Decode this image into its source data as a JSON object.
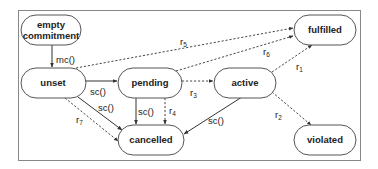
{
  "diagram": {
    "type": "state-machine",
    "frame": {
      "x": 18,
      "y": 10,
      "w": 342,
      "h": 150
    },
    "nodes": [
      {
        "id": "empty",
        "lines": [
          "empty",
          "commitment"
        ],
        "x": 21,
        "y": 15,
        "w": 60,
        "h": 30
      },
      {
        "id": "unset",
        "lines": [
          "unset"
        ],
        "x": 21,
        "y": 68,
        "w": 65,
        "h": 30
      },
      {
        "id": "pending",
        "lines": [
          "pending"
        ],
        "x": 118,
        "y": 68,
        "w": 64,
        "h": 30
      },
      {
        "id": "active",
        "lines": [
          "active"
        ],
        "x": 214,
        "y": 68,
        "w": 62,
        "h": 30
      },
      {
        "id": "fulfilled",
        "lines": [
          "fulfilled"
        ],
        "x": 294,
        "y": 15,
        "w": 62,
        "h": 30
      },
      {
        "id": "cancelled",
        "lines": [
          "cancelled"
        ],
        "x": 118,
        "y": 125,
        "w": 66,
        "h": 30
      },
      {
        "id": "violated",
        "lines": [
          "violated"
        ],
        "x": 294,
        "y": 125,
        "w": 62,
        "h": 30
      }
    ],
    "edges": [
      {
        "from": "empty",
        "to": "unset",
        "label": "mc()",
        "style": "solid"
      },
      {
        "from": "unset",
        "to": "pending",
        "label": "sc()",
        "style": "solid"
      },
      {
        "from": "unset",
        "to": "cancelled",
        "label": "sc()",
        "style": "solid"
      },
      {
        "from": "unset",
        "to": "cancelled",
        "label": "r7",
        "style": "dashed"
      },
      {
        "from": "unset",
        "to": "fulfilled",
        "label": "r5",
        "style": "dashed"
      },
      {
        "from": "pending",
        "to": "active",
        "label": "r3",
        "style": "dashed"
      },
      {
        "from": "pending",
        "to": "cancelled",
        "label": "sc()",
        "style": "solid"
      },
      {
        "from": "pending",
        "to": "cancelled",
        "label": "r4",
        "style": "dashed"
      },
      {
        "from": "pending",
        "to": "fulfilled",
        "label": "r6",
        "style": "dashed"
      },
      {
        "from": "active",
        "to": "fulfilled",
        "label": "r1",
        "style": "dashed"
      },
      {
        "from": "active",
        "to": "violated",
        "label": "r2",
        "style": "dashed"
      },
      {
        "from": "active",
        "to": "cancelled",
        "label": "sc()",
        "style": "solid"
      }
    ],
    "labels": {
      "mc": "mc()",
      "sc": "sc()",
      "r": "r",
      "r1": "1",
      "r2": "2",
      "r3": "3",
      "r4": "4",
      "r5": "5",
      "r6": "6",
      "r7": "7"
    },
    "colors": {
      "stroke": "#555555",
      "text": "#222222",
      "background": "#ffffff"
    }
  }
}
